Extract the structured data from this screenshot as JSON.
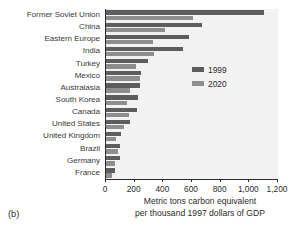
{
  "panel": {
    "label": "(b)"
  },
  "chart_data": {
    "type": "bar",
    "orientation": "horizontal",
    "title": "",
    "subtitle": "",
    "xlabel_line1": "Metric tons carbon equivalent",
    "xlabel_line2": "per thousand 1997 dollars of GDP",
    "ylabel": "",
    "xlim": [
      0,
      1200
    ],
    "xticks": [
      0,
      200,
      400,
      600,
      800,
      1000,
      1200
    ],
    "xtick_labels": [
      "0",
      "200",
      "400",
      "600",
      "800",
      "1,000",
      "1,200"
    ],
    "grid": false,
    "legend_position": "inside-right-upper",
    "plot_background": "#f2f2f2",
    "categories": [
      "Former Soviet Union",
      "China",
      "Eastern Europe",
      "India",
      "Turkey",
      "Mexico",
      "Australasia",
      "South Korea",
      "Canada",
      "United States",
      "United Kingdom",
      "Brazil",
      "Germany",
      "France"
    ],
    "series": [
      {
        "name": "1999",
        "color": "#5d5d5d",
        "values": [
          1100,
          670,
          580,
          535,
          290,
          245,
          240,
          225,
          215,
          165,
          105,
          100,
          95,
          65
        ]
      },
      {
        "name": "2020",
        "color": "#8e8e8e",
        "values": [
          610,
          410,
          325,
          335,
          210,
          235,
          170,
          145,
          160,
          125,
          70,
          85,
          65,
          45
        ]
      }
    ]
  }
}
